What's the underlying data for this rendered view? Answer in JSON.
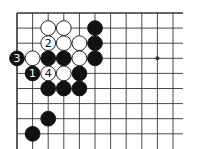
{
  "diagram": {
    "type": "go-board-fragment",
    "grid": {
      "columns": 11,
      "rows": 9,
      "origin_x": 17,
      "origin_y": 13,
      "spacing_x": 15.6,
      "spacing_y": 15.1,
      "right_extent": 183,
      "bottom_extent": 149,
      "top_edge": true,
      "left_edge": true
    },
    "star_points": [
      {
        "col": 9,
        "row": 3
      }
    ],
    "stones": [
      {
        "col": 2,
        "row": 1,
        "color": "white",
        "label": ""
      },
      {
        "col": 3,
        "row": 1,
        "color": "white",
        "label": ""
      },
      {
        "col": 5,
        "row": 1,
        "color": "black",
        "label": ""
      },
      {
        "col": 2,
        "row": 2,
        "color": "white",
        "label": "2"
      },
      {
        "col": 3,
        "row": 2,
        "color": "white",
        "label": ""
      },
      {
        "col": 4,
        "row": 2,
        "color": "white",
        "label": ""
      },
      {
        "col": 5,
        "row": 2,
        "color": "black",
        "label": ""
      },
      {
        "col": 0,
        "row": 3,
        "color": "black",
        "label": "3"
      },
      {
        "col": 1,
        "row": 3,
        "color": "white",
        "label": ""
      },
      {
        "col": 2,
        "row": 3,
        "color": "black",
        "label": ""
      },
      {
        "col": 3,
        "row": 3,
        "color": "black",
        "label": ""
      },
      {
        "col": 4,
        "row": 3,
        "color": "white",
        "label": ""
      },
      {
        "col": 5,
        "row": 3,
        "color": "black",
        "label": ""
      },
      {
        "col": 1,
        "row": 4,
        "color": "black",
        "label": "1"
      },
      {
        "col": 2,
        "row": 4,
        "color": "white",
        "label": "4"
      },
      {
        "col": 3,
        "row": 4,
        "color": "white",
        "label": ""
      },
      {
        "col": 4,
        "row": 4,
        "color": "black",
        "label": ""
      },
      {
        "col": 2,
        "row": 5,
        "color": "black",
        "label": ""
      },
      {
        "col": 3,
        "row": 5,
        "color": "black",
        "label": ""
      },
      {
        "col": 4,
        "row": 5,
        "color": "black",
        "label": ""
      },
      {
        "col": 2,
        "row": 7,
        "color": "black",
        "label": ""
      },
      {
        "col": 1,
        "row": 8,
        "color": "black",
        "label": ""
      }
    ],
    "colors": {
      "line": "#333333",
      "black_stone": "#111111",
      "white_stone": "#ffffff",
      "background": "#ffffff"
    }
  }
}
